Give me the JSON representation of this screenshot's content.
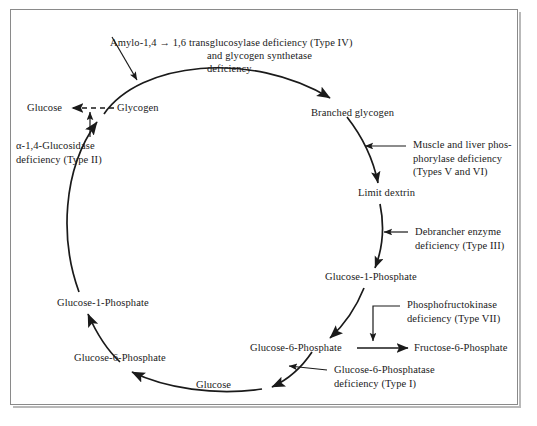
{
  "figure": {
    "frame_color": "#8a8a8a",
    "ink_color": "#1a1a1a",
    "background": "#ffffff"
  },
  "metabolites": {
    "glucose_left": "Glucose",
    "glycogen": "Glycogen",
    "branched_glycogen": "Branched glycogen",
    "limit_dextrin": "Limit dextrin",
    "glucose_1_phosphate_right": "Glucose-1-Phosphate",
    "glucose_6_phosphate_right": "Glucose-6-Phosphate",
    "fructose_6_phosphate": "Fructose-6-Phosphate",
    "glucose_bottom": "Glucose",
    "glucose_6_phosphate_left": "Glucose-6-Phosphate",
    "glucose_1_phosphate_left": "Glucose-1-Phosphate"
  },
  "deficiencies": {
    "type_iv": "Amylo-1,4 → 1,6 transglucosylase deficiency (Type IV)",
    "type_iv_line2": "and glycogen synthetase\ndeficiency",
    "type_ii": "α-1,4-Glucosidase\ndeficiency (Type II)",
    "types_v_vi": "Muscle and liver phos-\nphorylase deficiency\n(Types V and VI)",
    "type_iii": "Debrancher enzyme\ndeficiency (Type III)",
    "type_vii": "Phosphofructokinase\ndeficiency (Type VII)",
    "type_i": "Glucose-6-Phosphatase\ndeficiency (Type I)"
  }
}
